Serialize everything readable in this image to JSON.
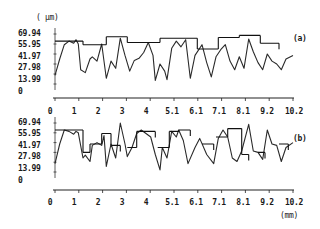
{
  "figure": {
    "unit_y": "( µm)",
    "unit_x": "(mm)"
  },
  "chart_data": [
    {
      "type": "line",
      "panel_label": "(a)",
      "ylabel": "( µm)",
      "xlabel": "(mm)",
      "y_ticks": [
        "69.94",
        "55.95",
        "41.97",
        "27.98",
        "13.99",
        "0"
      ],
      "x_ticks": [
        "0",
        "1",
        "2",
        "3",
        "4",
        "5.1",
        "6.1",
        "7.1",
        "8.1",
        "9.2",
        "10.2"
      ],
      "ylim": [
        0,
        69.94
      ],
      "xlim": [
        0,
        10.2
      ],
      "grid": false,
      "series": [
        {
          "name": "profile",
          "x": [
            0.0,
            0.2,
            0.4,
            0.6,
            0.8,
            0.9,
            1.0,
            1.1,
            1.3,
            1.5,
            1.6,
            1.8,
            2.0,
            2.2,
            2.4,
            2.6,
            2.8,
            3.0,
            3.2,
            3.4,
            3.6,
            3.8,
            4.0,
            4.2,
            4.3,
            4.5,
            4.7,
            4.8,
            5.0,
            5.2,
            5.4,
            5.6,
            5.8,
            6.0,
            6.3,
            6.5,
            6.7,
            6.9,
            7.1,
            7.3,
            7.5,
            7.7,
            7.9,
            8.1,
            8.3,
            8.5,
            8.7,
            8.9,
            9.1,
            9.3,
            9.5,
            9.7,
            9.9,
            10.2
          ],
          "y": [
            12,
            35,
            55,
            60,
            57,
            62,
            56,
            20,
            16,
            35,
            38,
            32,
            56,
            8,
            32,
            22,
            64,
            40,
            18,
            33,
            36,
            44,
            58,
            40,
            5,
            28,
            18,
            6,
            50,
            60,
            52,
            62,
            8,
            40,
            55,
            30,
            10,
            38,
            48,
            55,
            32,
            20,
            38,
            22,
            63,
            45,
            30,
            20,
            42,
            32,
            28,
            20,
            35,
            40
          ]
        },
        {
          "name": "step-envelope",
          "type": "step",
          "segments": [
            {
              "x0": 0.0,
              "x1": 1.2,
              "y": 60
            },
            {
              "x0": 1.2,
              "x1": 2.2,
              "y": 55
            },
            {
              "x0": 2.2,
              "x1": 3.1,
              "y": 66
            },
            {
              "x0": 3.1,
              "x1": 4.5,
              "y": 58
            },
            {
              "x0": 4.5,
              "x1": 6.1,
              "y": 64
            },
            {
              "x0": 6.1,
              "x1": 7.0,
              "y": 49
            },
            {
              "x0": 7.0,
              "x1": 7.9,
              "y": 65
            },
            {
              "x0": 7.9,
              "x1": 8.8,
              "y": 68
            },
            {
              "x0": 8.8,
              "x1": 9.6,
              "y": 57
            }
          ]
        }
      ]
    },
    {
      "type": "line",
      "panel_label": "(b)",
      "ylabel": "( µm)",
      "xlabel": "(mm)",
      "y_ticks": [
        "69.94",
        "55.95",
        "41.97",
        "27.98",
        "13.99",
        "0"
      ],
      "x_ticks": [
        "0",
        "1",
        "2",
        "3",
        "4",
        "5.1",
        "6.1",
        "7.1",
        "8.1",
        "9.2",
        "10.2"
      ],
      "ylim": [
        0,
        69.94
      ],
      "xlim": [
        0,
        10.2
      ],
      "grid": false,
      "series": [
        {
          "name": "profile",
          "x": [
            0.0,
            0.2,
            0.4,
            0.6,
            0.8,
            0.9,
            1.0,
            1.2,
            1.3,
            1.5,
            1.6,
            1.8,
            2.0,
            2.1,
            2.2,
            2.4,
            2.6,
            2.8,
            3.0,
            3.1,
            3.3,
            3.5,
            3.7,
            3.9,
            4.1,
            4.3,
            4.5,
            4.6,
            4.8,
            5.0,
            5.2,
            5.3,
            5.5,
            5.7,
            6.0,
            6.2,
            6.5,
            6.8,
            7.0,
            7.2,
            7.4,
            7.6,
            7.8,
            8.0,
            8.3,
            8.5,
            8.7,
            8.9,
            9.1,
            9.3,
            9.5,
            9.7,
            9.9,
            10.2
          ],
          "y": [
            12,
            40,
            60,
            58,
            54,
            58,
            56,
            20,
            24,
            15,
            38,
            42,
            38,
            52,
            8,
            40,
            20,
            70,
            40,
            22,
            35,
            55,
            60,
            55,
            50,
            25,
            3,
            35,
            20,
            58,
            50,
            60,
            45,
            12,
            35,
            48,
            25,
            12,
            48,
            60,
            50,
            20,
            15,
            30,
            68,
            30,
            28,
            18,
            60,
            40,
            38,
            15,
            35,
            42
          ]
        },
        {
          "name": "step-envelope",
          "type": "step",
          "segments": [
            {
              "x0": 0.0,
              "x1": 1.2,
              "y": 60
            },
            {
              "x0": 1.2,
              "x1": 1.5,
              "y": 28
            },
            {
              "x0": 1.5,
              "x1": 2.0,
              "y": 40
            },
            {
              "x0": 2.0,
              "x1": 2.4,
              "y": 55
            },
            {
              "x0": 2.4,
              "x1": 2.8,
              "y": 38
            },
            {
              "x0": 3.1,
              "x1": 3.5,
              "y": 35
            },
            {
              "x0": 3.5,
              "x1": 4.3,
              "y": 58
            },
            {
              "x0": 4.4,
              "x1": 4.9,
              "y": 35
            },
            {
              "x0": 4.9,
              "x1": 5.3,
              "y": 58
            },
            {
              "x0": 5.3,
              "x1": 5.8,
              "y": 60
            },
            {
              "x0": 6.3,
              "x1": 6.8,
              "y": 40
            },
            {
              "x0": 6.9,
              "x1": 7.4,
              "y": 50
            },
            {
              "x0": 7.4,
              "x1": 8.0,
              "y": 62
            },
            {
              "x0": 8.0,
              "x1": 8.3,
              "y": 25
            },
            {
              "x0": 8.7,
              "x1": 9.0,
              "y": 28
            },
            {
              "x0": 9.6,
              "x1": 10.0,
              "y": 40
            }
          ]
        }
      ]
    }
  ]
}
